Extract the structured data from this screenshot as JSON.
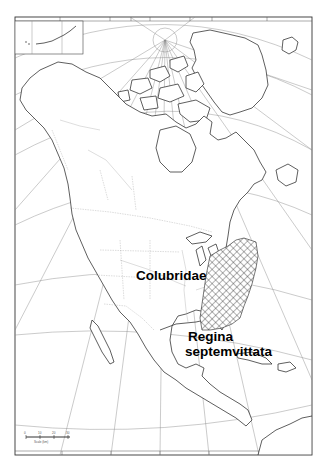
{
  "map": {
    "title": "Regina septemvittata range map",
    "family_label": "Colubridae",
    "species_label_line1": "Regina",
    "species_label_line2": "septemvittata",
    "region": "North America",
    "range_fill": "crosshatch",
    "colors": {
      "background": "#ffffff",
      "outline": "#2a2a2a",
      "graticule": "#8a8a8a",
      "label": "#000000"
    },
    "scale_bar": {
      "ticks": [
        "0",
        "10",
        "20",
        "30"
      ],
      "caption": "Scale (km)"
    },
    "inset": {
      "name": "Aleutian Islands inset"
    }
  }
}
